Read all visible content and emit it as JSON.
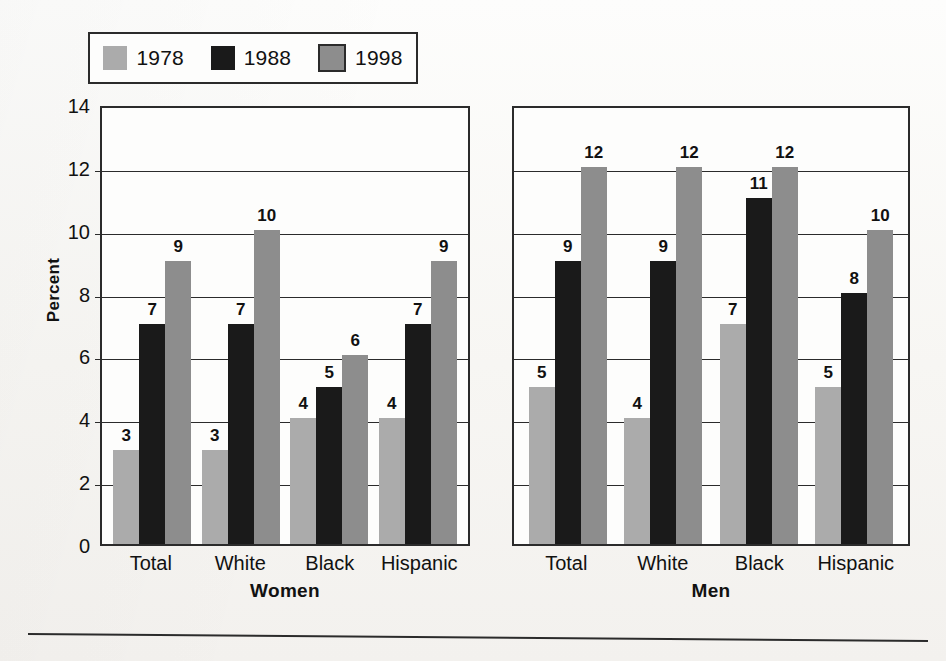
{
  "legend": {
    "entries": [
      {
        "label": "1978",
        "color": "#ababab"
      },
      {
        "label": "1988",
        "color": "#1a1a1a"
      },
      {
        "label": "1998",
        "color": "#8d8d8d"
      }
    ]
  },
  "axis": {
    "ylabel": "Percent",
    "yticks": [
      "0",
      "2",
      "4",
      "6",
      "8",
      "10",
      "12",
      "14"
    ]
  },
  "panels": [
    {
      "title": "Women"
    },
    {
      "title": "Men"
    }
  ],
  "chart_data": {
    "type": "bar",
    "title": "",
    "subtitle": "",
    "xlabel": "",
    "ylabel": "Percent",
    "ylim": [
      0,
      14
    ],
    "ytick_step": 2,
    "grid": true,
    "legend_position": "top-left",
    "series_colors": {
      "1978": "#ababab",
      "1988": "#1a1a1a",
      "1998": "#8d8d8d"
    },
    "panels": [
      {
        "name": "Women",
        "categories": [
          "Total",
          "White",
          "Black",
          "Hispanic"
        ],
        "series": [
          {
            "name": "1978",
            "values": [
              3,
              3,
              4,
              4
            ]
          },
          {
            "name": "1988",
            "values": [
              7,
              7,
              5,
              7
            ]
          },
          {
            "name": "1998",
            "values": [
              9,
              10,
              6,
              9
            ]
          }
        ]
      },
      {
        "name": "Men",
        "categories": [
          "Total",
          "White",
          "Black",
          "Hispanic"
        ],
        "series": [
          {
            "name": "1978",
            "values": [
              5,
              4,
              7,
              5
            ]
          },
          {
            "name": "1988",
            "values": [
              9,
              9,
              11,
              8
            ]
          },
          {
            "name": "1998",
            "values": [
              12,
              12,
              12,
              10
            ]
          }
        ]
      }
    ]
  }
}
